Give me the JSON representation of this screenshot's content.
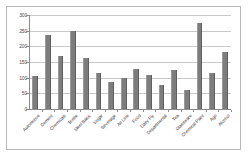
{
  "chart_data": {
    "type": "bar",
    "title": "",
    "xlabel": "",
    "ylabel": "",
    "ylim": [
      0,
      300
    ],
    "y_ticks": [
      0,
      50,
      100,
      150,
      200,
      250,
      300
    ],
    "grid": true,
    "legend": false,
    "bar_color": "#7d7d7d",
    "categories": [
      "Automotive",
      "Cement",
      "Chemicals",
      "Textile",
      "Steel Basic",
      "Sugar",
      "Beverage",
      "Air Line",
      "Food",
      "Dairy Fly",
      "Departmental",
      "Tea",
      "Glassware",
      "Chemical Plant",
      "Agri",
      "Alcohol"
    ],
    "values": [
      105,
      235,
      168,
      250,
      163,
      115,
      85,
      100,
      128,
      108,
      78,
      125,
      62,
      275,
      115,
      182
    ],
    "series": [
      {
        "name": "Series 1",
        "values": [
          105,
          235,
          168,
          250,
          163,
          115,
          85,
          100,
          128,
          108,
          78,
          125,
          62,
          275,
          115,
          182
        ]
      }
    ]
  },
  "axes": {
    "y_tick_labels": [
      "300",
      "250",
      "200",
      "150",
      "100",
      "50",
      "0"
    ]
  }
}
